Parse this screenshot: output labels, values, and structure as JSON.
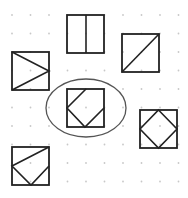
{
  "diagram": {
    "type": "dot-grid figure puzzle",
    "grid": {
      "columns": 10,
      "rows": 10,
      "dot_color": "#c8c8c8"
    },
    "stroke_color": "#222222",
    "figures": [
      {
        "id": "A",
        "name": "square-with-right-pointing-triangle",
        "description": "square with lines from both left corners meeting at the middle of the right side"
      },
      {
        "id": "B",
        "name": "square-with-vertical-divider",
        "description": "square split by a vertical line through the middle"
      },
      {
        "id": "C",
        "name": "square-with-diagonal",
        "description": "square with a diagonal from bottom-left to top-right"
      },
      {
        "id": "D",
        "name": "square-with-partial-diamond",
        "description": "square with three edges of an inscribed diamond (top, left, bottom, right midpoints joined, top-right edge missing)",
        "highlighted": true
      },
      {
        "id": "E",
        "name": "square-with-inscribed-diamond",
        "description": "square with a full diamond joining the midpoints of each side"
      },
      {
        "id": "F",
        "name": "square-with-zigzag",
        "description": "square with line from top-right corner to left midpoint, then to bottom midpoint, then to right midpoint"
      }
    ],
    "highlight": {
      "shape": "ellipse",
      "target": "D",
      "color": "#555555"
    }
  }
}
